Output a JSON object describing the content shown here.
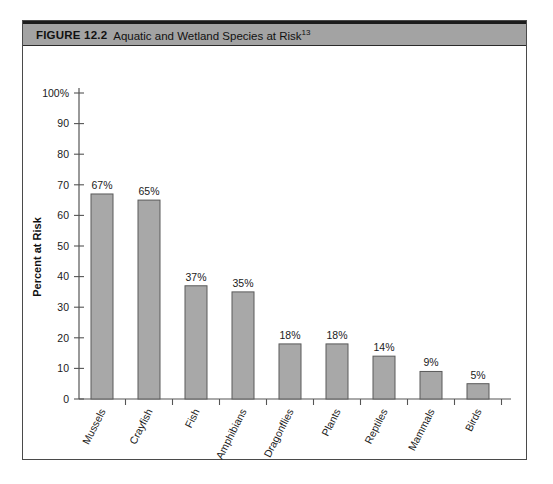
{
  "figure": {
    "label": "FIGURE 12.2",
    "title": "Aquatic and Wetland Species at Risk",
    "title_superscript": "13"
  },
  "colors": {
    "caption_bar_bg": "#a3a3a3",
    "caption_bar_border": "#1c1c1c",
    "frame_border": "#4a4a4a",
    "bar_fill": "#a8a8a8",
    "bar_stroke": "#5a5a5a",
    "axis": "#555555",
    "text": "#1a1a1a",
    "page_bg": "#ffffff"
  },
  "chart_data": {
    "type": "bar",
    "title": "Aquatic and Wetland Species at Risk",
    "xlabel": "",
    "ylabel": "Percent at Risk",
    "ylim": [
      0,
      100
    ],
    "yticks": [
      0,
      10,
      20,
      30,
      40,
      50,
      60,
      70,
      80,
      90,
      100
    ],
    "ytick_labels": [
      "0",
      "10",
      "20",
      "30",
      "40",
      "50",
      "60",
      "70",
      "80",
      "90",
      "100%"
    ],
    "grid": false,
    "legend": null,
    "categories": [
      "Mussels",
      "Crayfish",
      "Fish",
      "Amphibians",
      "Dragonflies",
      "Plants",
      "Reptiles",
      "Mammals",
      "Birds"
    ],
    "values": [
      67,
      65,
      37,
      35,
      18,
      18,
      14,
      9,
      5
    ],
    "value_labels": [
      "67%",
      "65%",
      "37%",
      "35%",
      "18%",
      "18%",
      "14%",
      "9%",
      "5%"
    ]
  }
}
